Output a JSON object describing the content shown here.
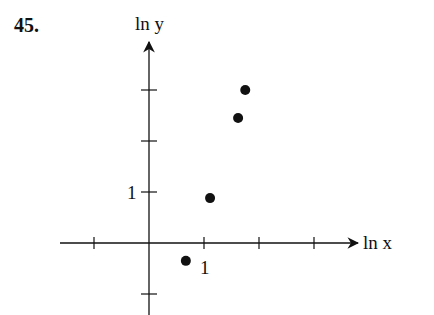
{
  "problem": {
    "number": "45."
  },
  "chart_data": {
    "type": "scatter",
    "title": "",
    "xlabel": "ln x",
    "ylabel": "ln y",
    "x_ticks": [
      -1,
      1,
      2,
      3
    ],
    "y_ticks": [
      -1,
      1,
      2,
      3
    ],
    "x_tick_labels_shown": {
      "1": "1"
    },
    "y_tick_labels_shown": {
      "1": "1"
    },
    "xlim": [
      -1.6,
      4.0
    ],
    "ylim": [
      -1.4,
      3.8
    ],
    "grid": false,
    "points": [
      {
        "x": 0.67,
        "y": -0.35
      },
      {
        "x": 1.11,
        "y": 0.88
      },
      {
        "x": 1.62,
        "y": 2.45
      },
      {
        "x": 1.75,
        "y": 3.0
      }
    ]
  },
  "layout": {
    "origin_px": [
      149,
      243
    ],
    "x_unit_px": 55,
    "y_unit_px": 51
  }
}
